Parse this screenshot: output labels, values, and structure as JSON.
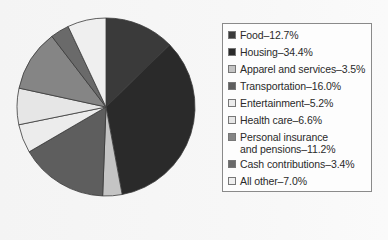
{
  "chart_data": {
    "type": "pie",
    "title": "",
    "categories": [
      "Food",
      "Housing",
      "Apparel and services",
      "Transportation",
      "Entertainment",
      "Health care",
      "Personal insurance and pensions",
      "Cash contributions",
      "All other"
    ],
    "values": [
      12.7,
      34.4,
      3.5,
      16.0,
      5.2,
      6.6,
      11.2,
      3.4,
      7.0
    ],
    "colors": [
      "#3a3a3a",
      "#2a2a2a",
      "#c4c4c4",
      "#5e5e5e",
      "#ececec",
      "#e6e6e6",
      "#858585",
      "#6a6a6a",
      "#efefef"
    ],
    "start_angle": "12 o'clock",
    "direction": "clockwise",
    "legend_position": "right"
  },
  "legend": {
    "items": [
      {
        "label": "Food–12.7%",
        "color": "#3a3a3a"
      },
      {
        "label": "Housing–34.4%",
        "color": "#2a2a2a"
      },
      {
        "label": "Apparel and services–3.5%",
        "color": "#c4c4c4"
      },
      {
        "label": "Transportation–16.0%",
        "color": "#5e5e5e"
      },
      {
        "label": "Entertainment–5.2%",
        "color": "#ececec"
      },
      {
        "label": "Health care–6.6%",
        "color": "#e6e6e6"
      },
      {
        "label": "Personal insurance\nand pensions–11.2%",
        "color": "#858585"
      },
      {
        "label": "Cash contributions–3.4%",
        "color": "#6a6a6a"
      },
      {
        "label": "All other–7.0%",
        "color": "#efefef"
      }
    ]
  }
}
